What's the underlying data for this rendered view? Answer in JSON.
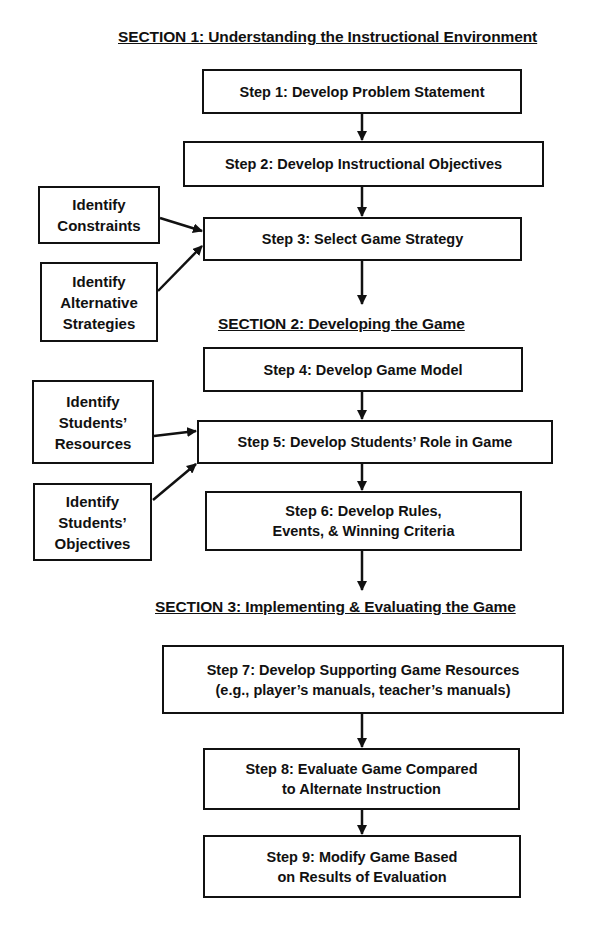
{
  "sections": [
    {
      "title": "SECTION 1: Understanding the Instructional Environment"
    },
    {
      "title": "SECTION 2: Developing the Game"
    },
    {
      "title": "SECTION 3: Implementing & Evaluating the Game"
    }
  ],
  "steps": [
    {
      "lines": [
        "Step 1: Develop Problem Statement"
      ]
    },
    {
      "lines": [
        "Step 2: Develop Instructional Objectives"
      ]
    },
    {
      "lines": [
        "Step 3: Select Game Strategy"
      ]
    },
    {
      "lines": [
        "Step 4: Develop Game Model"
      ]
    },
    {
      "lines": [
        "Step 5: Develop Students’ Role in Game"
      ]
    },
    {
      "lines": [
        "Step 6: Develop Rules,",
        "Events, & Winning Criteria"
      ]
    },
    {
      "lines": [
        "Step 7: Develop Supporting Game Resources",
        "(e.g., player’s manuals, teacher’s manuals)"
      ]
    },
    {
      "lines": [
        "Step 8: Evaluate Game Compared",
        "to Alternate Instruction"
      ]
    },
    {
      "lines": [
        "Step 9: Modify Game Based",
        "on Results of Evaluation"
      ]
    }
  ],
  "inputs": [
    {
      "lines": [
        "Identify",
        "Constraints"
      ],
      "target": "Step 3"
    },
    {
      "lines": [
        "Identify",
        "Alternative",
        "Strategies"
      ],
      "target": "Step 3"
    },
    {
      "lines": [
        "Identify",
        "Students’",
        "Resources"
      ],
      "target": "Step 5"
    },
    {
      "lines": [
        "Identify",
        "Students’",
        "Objectives"
      ],
      "target": "Step 5"
    }
  ]
}
